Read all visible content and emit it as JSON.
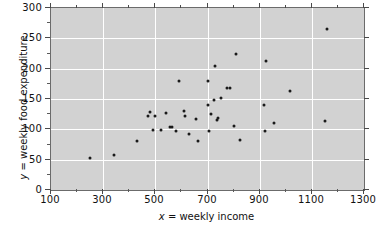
{
  "chart_data": {
    "type": "scatter",
    "title": "",
    "xlabel": "x = weekly income",
    "ylabel": "y = weekly food expenditure",
    "xlim": [
      100,
      1300
    ],
    "ylim": [
      0,
      300
    ],
    "xticks": [
      100,
      300,
      500,
      700,
      900,
      1100,
      1300
    ],
    "xticklabels": [
      "100",
      "300",
      "500",
      "700",
      "900",
      "1100",
      "1300"
    ],
    "xminorticks": [
      200,
      400,
      600,
      800,
      1000,
      1200
    ],
    "yticks": [
      0,
      50,
      100,
      150,
      200,
      250,
      300
    ],
    "yticklabels": [
      "0",
      "50",
      "100",
      "150",
      "200",
      "250",
      "300"
    ],
    "grid": true,
    "grid_color": "#ffffff",
    "plot_background": "#d2d2d2",
    "marker_color": "#1a1a1a",
    "legend": null,
    "series": [
      {
        "name": "households",
        "points": [
          [
            250,
            53
          ],
          [
            340,
            58
          ],
          [
            430,
            81
          ],
          [
            470,
            122
          ],
          [
            480,
            129
          ],
          [
            490,
            99
          ],
          [
            500,
            122
          ],
          [
            520,
            99
          ],
          [
            540,
            127
          ],
          [
            555,
            104
          ],
          [
            565,
            104
          ],
          [
            580,
            98
          ],
          [
            590,
            180
          ],
          [
            610,
            130
          ],
          [
            615,
            122
          ],
          [
            630,
            92
          ],
          [
            655,
            117
          ],
          [
            665,
            81
          ],
          [
            700,
            180
          ],
          [
            700,
            140
          ],
          [
            705,
            97
          ],
          [
            715,
            126
          ],
          [
            725,
            148
          ],
          [
            730,
            205
          ],
          [
            735,
            116
          ],
          [
            740,
            119
          ],
          [
            750,
            151
          ],
          [
            775,
            168
          ],
          [
            785,
            168
          ],
          [
            800,
            106
          ],
          [
            810,
            225
          ],
          [
            825,
            83
          ],
          [
            915,
            140
          ],
          [
            920,
            97
          ],
          [
            925,
            212
          ],
          [
            955,
            111
          ],
          [
            1015,
            164
          ],
          [
            1150,
            113
          ],
          [
            1160,
            265
          ]
        ]
      }
    ]
  }
}
